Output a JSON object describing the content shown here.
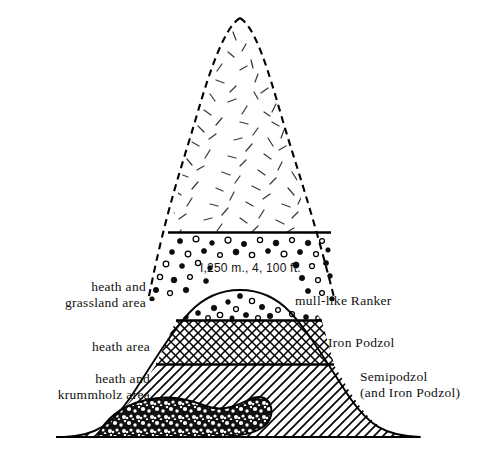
{
  "figure": {
    "type": "schematic-cross-section",
    "title_visible": false,
    "background_color": "#ffffff",
    "ink_color": "#000000"
  },
  "annotations": {
    "elevation_note": "I,250 m., 4, 100 ft."
  },
  "left_labels": [
    {
      "id": "heath-grassland",
      "line1": "heath and",
      "line2": "grassland area"
    },
    {
      "id": "heath",
      "line1": "heath area",
      "line2": ""
    },
    {
      "id": "heath-krummholz",
      "line1": "heath and",
      "line2": "krummholz area"
    }
  ],
  "right_labels": [
    {
      "id": "mull-like-ranker",
      "line1": "mull-like  Ranker",
      "line2": ""
    },
    {
      "id": "iron-podzol",
      "line1": "Iron Podzol",
      "line2": ""
    },
    {
      "id": "semipodzol",
      "line1": "Semipodzol",
      "line2": "(and Iron Podzol)"
    }
  ],
  "zones": [
    {
      "id": "upper-peak",
      "pattern": "short-dashes",
      "outline": "dashed"
    },
    {
      "id": "ranker-dotted",
      "pattern": "stones-dots",
      "outline": "dashed"
    },
    {
      "id": "iron-podzol-band",
      "pattern": "crosshatch",
      "outline": "solid"
    },
    {
      "id": "semipodzol-band",
      "pattern": "diagonal-hatch",
      "outline": "solid"
    },
    {
      "id": "krummholz-blob",
      "pattern": "dense-gravel",
      "outline": "solid"
    }
  ]
}
